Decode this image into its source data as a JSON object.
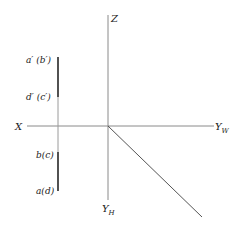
{
  "diagram": {
    "axes": {
      "z_label": "Z",
      "x_label": "X",
      "yw_label": "Y",
      "yw_sub": "W",
      "yh_label": "Y",
      "yh_sub": "H"
    },
    "projection_labels": {
      "upper_top": "a′ (b′)",
      "upper_bottom": "d′ (c′)",
      "lower_top": "b(c)",
      "lower_bottom": "a(d)"
    },
    "colors": {
      "axis": "#8a8a8a",
      "segment": "#333333",
      "text": "#222222"
    }
  }
}
